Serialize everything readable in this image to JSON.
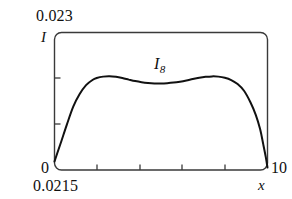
{
  "figure": {
    "name": "intensity-distribution-figure"
  },
  "axes": {
    "y_max_label": "0.023",
    "y_min_label": "0",
    "y_axis_name": "I",
    "x_min_label": "0.0215",
    "x_max_label": "10",
    "x_axis_name": "x"
  },
  "annotation": {
    "curve_label_base": "I",
    "curve_label_sub": "8"
  },
  "style": {
    "curve_color": "#111111",
    "frame_color": "#3a3a3a",
    "background": "#ffffff"
  },
  "chart_data": {
    "type": "line",
    "title": "",
    "subtitle": "",
    "xlabel": "x",
    "ylabel": "I",
    "xlim": [
      0.0215,
      10
    ],
    "ylim": [
      0,
      0.023
    ],
    "xticks": [
      2,
      4,
      6,
      8
    ],
    "xtick_labels": [
      "",
      "",
      "",
      ""
    ],
    "yticks": [
      0.0077,
      0.0153
    ],
    "ytick_labels": [
      "",
      ""
    ],
    "grid": false,
    "legend": null,
    "annotations": [
      {
        "text": "I_8",
        "x": 5.0,
        "y": 0.0182,
        "note": "curve identifier placed above the central dip"
      }
    ],
    "series": [
      {
        "name": "I_8",
        "color": "#111111",
        "x": [
          0.0215,
          0.15,
          0.35,
          0.6,
          0.9,
          1.2,
          1.5,
          1.8,
          2.0,
          2.3,
          2.6,
          2.9,
          3.2,
          3.5,
          3.8,
          4.1,
          4.4,
          4.7,
          5.0,
          5.3,
          5.6,
          5.9,
          6.2,
          6.5,
          6.8,
          7.1,
          7.4,
          7.7,
          8.0,
          8.3,
          8.6,
          8.9,
          9.2,
          9.45,
          9.65,
          9.8,
          9.92,
          10
        ],
        "y": [
          0.00143,
          0.0028,
          0.0049,
          0.0076,
          0.0106,
          0.0127,
          0.0142,
          0.01505,
          0.01538,
          0.01562,
          0.01568,
          0.01558,
          0.01538,
          0.01512,
          0.01487,
          0.01468,
          0.01455,
          0.01448,
          0.01447,
          0.01452,
          0.01462,
          0.01478,
          0.01498,
          0.01522,
          0.01543,
          0.01558,
          0.01566,
          0.01562,
          0.01543,
          0.01505,
          0.01438,
          0.01325,
          0.01133,
          0.00922,
          0.00688,
          0.00432,
          0.00215,
          0.0004
        ]
      }
    ]
  }
}
